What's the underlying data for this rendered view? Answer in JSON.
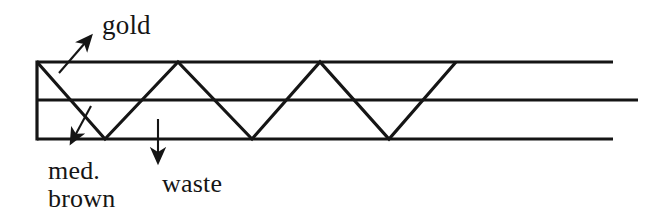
{
  "figure": {
    "title": "",
    "background_color": "#ffffff",
    "stroke_color": "#151515",
    "width": 652,
    "height": 220
  },
  "labels": {
    "gold": "gold",
    "med_brown_line1": "med.",
    "med_brown_line2": "brown",
    "waste": "waste"
  },
  "annotations": {
    "gold_arrow": "arrow-up-right",
    "med_brown_arrow": "arrow-down-left",
    "waste_arrow": "arrow-down"
  },
  "diagram": {
    "rails": [
      {
        "name": "top-rail",
        "y": 62,
        "x_start": 37,
        "x_end": 613
      },
      {
        "name": "middle-rail",
        "y": 100,
        "x_start": 37,
        "x_end": 638
      },
      {
        "name": "bottom-rail",
        "y": 139,
        "x_start": 37,
        "x_end": 613
      }
    ],
    "left_edge": {
      "x": 37,
      "y_top": 62,
      "y_bottom": 139
    },
    "zigzag_points": "37,62 105,139 178,62 252,139 320,62 389,139 456,62",
    "zigzag_peaks_top_x": [
      37,
      178,
      320,
      456
    ],
    "zigzag_valleys_bottom_x": [
      105,
      252,
      389
    ],
    "stroke_width": 3.2
  }
}
